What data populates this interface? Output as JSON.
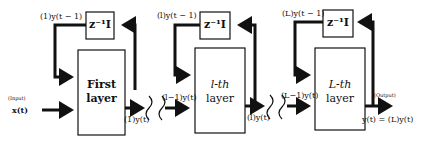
{
  "diagram": {
    "input": {
      "tag": "(Input)",
      "signal": "x(t)"
    },
    "output": {
      "tag": "(Output)",
      "signal": "y(t) = (L)y(t)"
    },
    "layers": [
      {
        "name": "First\nlayer",
        "line1": "First",
        "line2": "layer",
        "delay": "z⁻¹I",
        "feedback_label": "(1)y(t − 1)",
        "out_label": "(1)y(t)"
      },
      {
        "name": "l-th layer",
        "line1": "l-th",
        "line2": "layer",
        "delay": "z⁻¹I",
        "feedback_label": "(l)y(t − 1)",
        "in_label": "(l−1)y(t)",
        "out_label": "(l)y(t)"
      },
      {
        "name": "L-th layer",
        "line1": "L-th",
        "line2": "layer",
        "delay": "z⁻¹I",
        "feedback_label": "(L)y(t − 1)",
        "in_label": "(L−1)y(t)"
      }
    ]
  }
}
